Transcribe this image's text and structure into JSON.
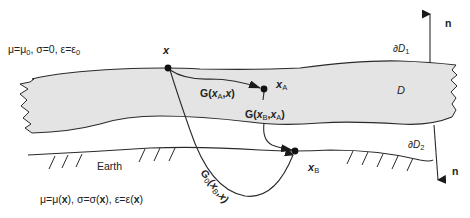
{
  "diagram": {
    "type": "electromagnetic-domain-schematic",
    "colors": {
      "domain_fill": "#e4e4e4",
      "line": "#2a2a2a",
      "background": "#ffffff"
    },
    "labels": {
      "free_space_params": "μ=μ0, σ=0, ε=ε0",
      "earth_params": "μ=μ(x), σ=σ(x), ε=ε(x)",
      "earth": "Earth",
      "domain": "D",
      "boundary_1": "∂D1",
      "boundary_2": "∂D2",
      "normal_top": "n",
      "normal_bottom": "n",
      "point_x": "x",
      "point_xA": "xA",
      "point_xB": "xB",
      "green_A_x": "G(xA,x)",
      "green_B_A": "G(xB,xA)",
      "green0_B_x": "G0(xB,x)"
    },
    "nodes": [
      {
        "id": "x",
        "label": "x",
        "cx": 168,
        "cy": 68
      },
      {
        "id": "xA",
        "label": "xA",
        "cx": 264,
        "cy": 89
      },
      {
        "id": "xB",
        "label": "xB",
        "cx": 295,
        "cy": 151
      }
    ],
    "edges": [
      {
        "from": "x",
        "to": "xA",
        "label": "G(xA,x)"
      },
      {
        "from": "xA",
        "to": "xB",
        "label": "G(xB,xA)"
      },
      {
        "from": "x",
        "to": "xB",
        "label": "G0(xB,x)"
      }
    ]
  }
}
